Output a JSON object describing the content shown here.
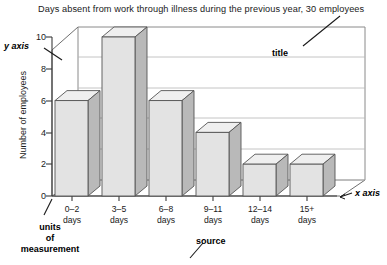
{
  "chart_data": {
    "type": "bar",
    "title": "Days absent from work through illness during the previous year, 30 employees",
    "xlabel": "",
    "ylabel": "Number of employees",
    "categories": [
      "0–2 days",
      "3–5 days",
      "6–8 days",
      "9–11 days",
      "12–14 days",
      "15+ days"
    ],
    "category_lines": [
      [
        "0–2",
        "days"
      ],
      [
        "3–5",
        "days"
      ],
      [
        "6–8",
        "days"
      ],
      [
        "9–11",
        "days"
      ],
      [
        "12–14",
        "days"
      ],
      [
        "15+",
        "days"
      ]
    ],
    "values": [
      6,
      10,
      6,
      4,
      2,
      2
    ],
    "ylim": [
      0,
      10
    ],
    "yticks": [
      0,
      2,
      4,
      6,
      8,
      10
    ],
    "ytick_labels": [
      "0",
      "2",
      "4",
      "6",
      "8",
      "10"
    ],
    "grid": true,
    "legend": null,
    "style": "3d-column",
    "colors": {
      "bar_front": "#e3e3e3",
      "bar_side": "#b9b9b9",
      "bar_top": "#efefef",
      "bar_outline": "#555555",
      "axis": "#4a4a4a",
      "wall": "#8a8a8a",
      "text": "#1a1a1a"
    }
  },
  "annotations": {
    "title_label": "title",
    "y_axis_label": "y axis",
    "x_axis_label": "x axis",
    "units_line1": "units",
    "units_line2": "of",
    "units_line3": "measurement",
    "source_label": "source"
  }
}
